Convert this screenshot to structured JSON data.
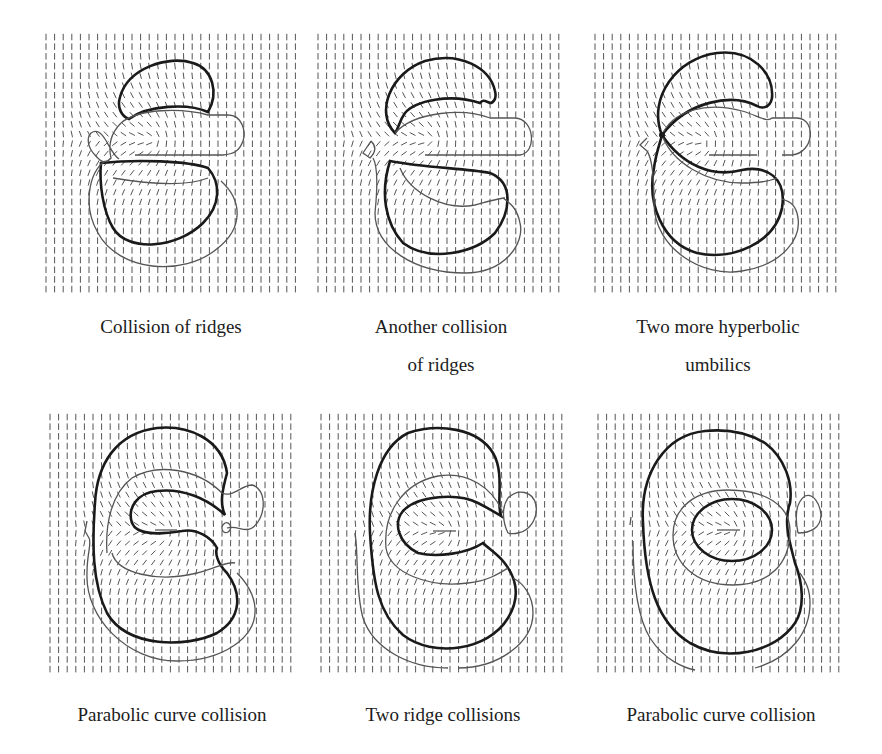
{
  "figure": {
    "panels": [
      {
        "id": "p1",
        "caption_lines": [
          "Collision of ridges"
        ]
      },
      {
        "id": "p2",
        "caption_lines": [
          "Another collision",
          "of ridges"
        ]
      },
      {
        "id": "p3",
        "caption_lines": [
          "Two more hyperbolic",
          "umbilics"
        ]
      },
      {
        "id": "p4",
        "caption_lines": [
          "Parabolic curve collision"
        ]
      },
      {
        "id": "p5",
        "caption_lines": [
          "Two ridge collisions"
        ]
      },
      {
        "id": "p6",
        "caption_lines": [
          "Parabolic curve collision"
        ]
      }
    ],
    "colors": {
      "field": "#555555",
      "bold_curve": "#1a1a1a",
      "thin_curve": "#555555"
    }
  }
}
